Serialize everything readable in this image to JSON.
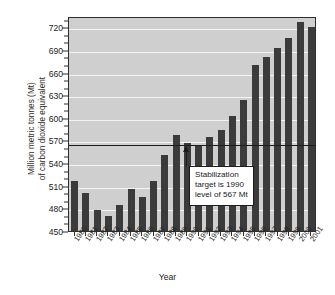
{
  "chart_data": {
    "type": "bar",
    "title": "",
    "xlabel": "Year",
    "ylabel": "Million metric tonnes (Mt) of carbon dioxide equivalent",
    "ylabel_line1": "Million metric tonnes (Mt)",
    "ylabel_line2": "of carbon dioxide equivalent",
    "ylim": [
      450,
      735
    ],
    "ytick_values": [
      450,
      480,
      510,
      540,
      570,
      600,
      630,
      660,
      690,
      720
    ],
    "ytick_labels": [
      "450",
      "480",
      "510",
      "540",
      "570",
      "600",
      "630",
      "660",
      "690",
      "720"
    ],
    "grid": true,
    "grid_color": "#f4f4f4",
    "plot_background": "#cfcfcf",
    "bar_color": "#3b3b3b",
    "legend": null,
    "categories": [
      "1980",
      "1981",
      "1982",
      "1983",
      "1984",
      "1985",
      "1986",
      "1987",
      "1988",
      "1989",
      "1990",
      "1991",
      "1992",
      "1993",
      "1994",
      "1995",
      "1996",
      "1997",
      "1998",
      "1999",
      "2000",
      "2001"
    ],
    "values": [
      516,
      500,
      478,
      470,
      485,
      506,
      495,
      516,
      551,
      577,
      567,
      563,
      575,
      584,
      603,
      624,
      670,
      681,
      692,
      706,
      727,
      720
    ],
    "reference_line": {
      "value": 567,
      "label": "Stabilization target is 1990 level of 567 Mt",
      "color": "#1c1c1c"
    },
    "annotation": {
      "line1": "Stabilization",
      "line2": "target is 1990",
      "line3": "level of 567 Mt",
      "points_to_category": "1990"
    }
  }
}
